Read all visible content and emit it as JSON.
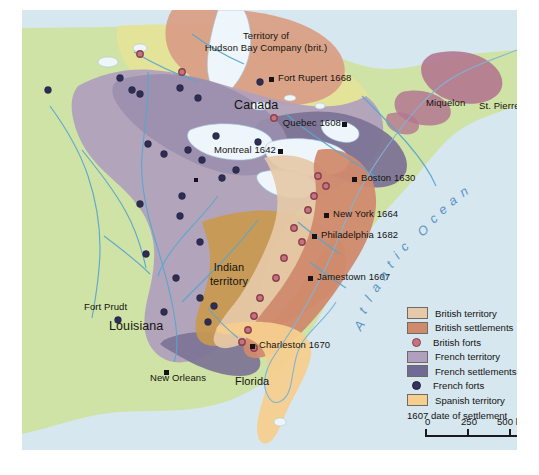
{
  "map": {
    "title": "Colonial North America c. 1700",
    "ocean_label": "Atlantic Ocean",
    "regions": [
      {
        "name": "Canada",
        "label": "Canada"
      },
      {
        "name": "Louisiana",
        "label": "Louisiana"
      },
      {
        "name": "Indian territory",
        "label": "Indian\nterritory"
      },
      {
        "name": "Florida",
        "label": "Florida"
      }
    ],
    "labels": {
      "hudson_line1": "Territory of",
      "hudson_line2": "Hudson Bay Company (brit.)",
      "canada": "Canada",
      "louisiana": "Louisiana",
      "indian_1": "Indian",
      "indian_2": "territory",
      "florida": "Florida",
      "miquelon": "Miquelon",
      "st_pierre": "St. Pierre",
      "fort_prudt": "Fort Prudt"
    },
    "settlements": [
      {
        "name": "Fort Rupert",
        "label": "Fort Rupert 1668",
        "year": "1668"
      },
      {
        "name": "Quebec",
        "label": "Quebec 1608",
        "year": "1608"
      },
      {
        "name": "Montreal",
        "label": "Montreal 1642",
        "year": "1642"
      },
      {
        "name": "Boston",
        "label": "Boston 1630",
        "year": "1630"
      },
      {
        "name": "New York",
        "label": "New York 1664",
        "year": "1664"
      },
      {
        "name": "Philadelphia",
        "label": "Philadelphia 1682",
        "year": "1682"
      },
      {
        "name": "Jamestown",
        "label": "Jamestown 1607",
        "year": "1607"
      },
      {
        "name": "Charleston",
        "label": "Charleston 1670",
        "year": "1670"
      },
      {
        "name": "New Orleans",
        "label": "New Orleans",
        "year": ""
      }
    ]
  },
  "legend": {
    "items": [
      {
        "label": "British territory",
        "type": "swatch",
        "color": "#e6c9a8"
      },
      {
        "label": "British settlements",
        "type": "swatch",
        "color": "#d08a6e"
      },
      {
        "label": "British forts",
        "type": "dot",
        "color": "#9e4a55"
      },
      {
        "label": "French territory",
        "type": "swatch",
        "color": "#b0a0bd"
      },
      {
        "label": "French settlements",
        "type": "swatch",
        "color": "#6f6a96"
      },
      {
        "label": "French forts",
        "type": "dot",
        "color": "#33335e"
      },
      {
        "label": "Spanish territory",
        "type": "swatch",
        "color": "#f5cf8e"
      }
    ],
    "note": "1607 date of settlement"
  },
  "scale": {
    "ticks": [
      "0",
      "250",
      "500 km"
    ],
    "unit": "km"
  },
  "colors": {
    "ocean": "#d6e7f0",
    "land_neutral": "#cfe3a6",
    "canada_interior": "#e3e39a",
    "british_territory": "#e6c9a8",
    "british_settlement": "#d08a6e",
    "french_territory": "#b0a0bd",
    "french_settlement": "#7d7396",
    "indian_territory": "#c9994e",
    "spanish_territory": "#f5cf8e",
    "hudson_territory": "#d99f86",
    "british_fort": "#9e4a55",
    "french_fort": "#2e2e55",
    "settlement_marker": "#1a1a1a",
    "river": "#5aa7cf",
    "lake": "#eef6fb"
  }
}
